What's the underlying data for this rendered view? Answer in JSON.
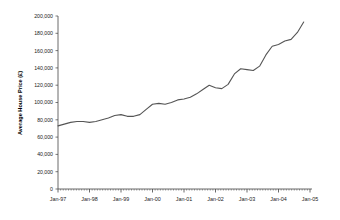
{
  "chart_data": {
    "type": "line",
    "title": "",
    "xlabel": "",
    "ylabel": "Average House Price (£)",
    "ylim": [
      0,
      200000
    ],
    "ytick_labels": [
      "0",
      "20,000",
      "40,000",
      "60,000",
      "80,000",
      "100,000",
      "120,000",
      "140,000",
      "160,000",
      "180,000",
      "200,000"
    ],
    "ytick_values": [
      0,
      20000,
      40000,
      60000,
      80000,
      100000,
      120000,
      140000,
      160000,
      180000,
      200000
    ],
    "xtick_labels": [
      "Jan-97",
      "Jan-98",
      "Jan-99",
      "Jan-00",
      "Jan-01",
      "Jan-02",
      "Jan-03",
      "Jan-04",
      "Jan-05"
    ],
    "xlim": [
      "Jan-97",
      "Jan-05"
    ],
    "grid": false,
    "legend": false,
    "line_color": "#555555",
    "series": [
      {
        "name": "Average House Price",
        "x": [
          "Jan-97",
          "Apr-97",
          "Jul-97",
          "Oct-97",
          "Jan-98",
          "Apr-98",
          "Jul-98",
          "Oct-98",
          "Jan-99",
          "Apr-99",
          "Jul-99",
          "Oct-99",
          "Jan-00",
          "Apr-00",
          "Jul-00",
          "Oct-00",
          "Jan-01",
          "Apr-01",
          "Jul-01",
          "Oct-01",
          "Jan-02",
          "Apr-02",
          "Jul-02",
          "Oct-02",
          "Jan-03",
          "Apr-03",
          "Jul-03",
          "Oct-03",
          "Jan-04",
          "Apr-04",
          "Jul-04",
          "Oct-04"
        ],
        "values": [
          73000,
          75000,
          77000,
          78000,
          78000,
          77000,
          78000,
          80000,
          82000,
          85000,
          86000,
          84000,
          84000,
          86000,
          92000,
          98000,
          99000,
          98000,
          100000,
          103000,
          104000,
          106000,
          110000,
          115000,
          120000,
          117000,
          116000,
          121000,
          133000,
          139000,
          138000,
          137000
        ]
      }
    ],
    "series_extra": {
      "x_tail": [
        "Jan-04b",
        "Mar-04",
        "May-04",
        "Jul-04b",
        "Sep-04",
        "Nov-04",
        "Dec-04"
      ],
      "values_tail": [
        142000,
        155000,
        165000,
        167000,
        171000,
        173000,
        181000,
        193000
      ]
    }
  }
}
